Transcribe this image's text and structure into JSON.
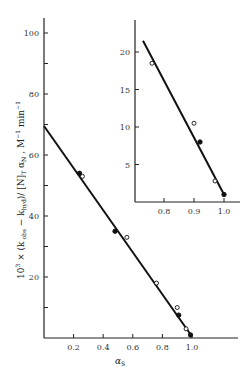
{
  "chart_data": [
    {
      "type": "scatter",
      "name": "main",
      "title": "",
      "xlabel": "α_S",
      "ylabel": "10³ × (k_obs − k_hyd)/ [N]_T α_N , M⁻¹ min⁻¹",
      "xlim": [
        0,
        1.1
      ],
      "ylim": [
        0,
        105
      ],
      "x_ticks": [
        0.2,
        0.4,
        0.6,
        0.8,
        1.0
      ],
      "x_tick_labels": [
        "0.2",
        "0.4",
        "0.6",
        "0.8",
        "1.0"
      ],
      "y_ticks": [
        10,
        20,
        30,
        40,
        50,
        60,
        70,
        80,
        90,
        100
      ],
      "y_tick_labels": [
        "20",
        "40",
        "60",
        "80",
        "100"
      ],
      "grid": false,
      "series": [
        {
          "name": "open circles",
          "marker": "open-circle",
          "x": [
            0.26,
            0.56,
            0.76,
            0.9,
            0.96
          ],
          "y": [
            53,
            33,
            18,
            10,
            3
          ]
        },
        {
          "name": "filled circles",
          "marker": "filled-circle",
          "x": [
            0.24,
            0.48,
            0.91,
            0.99
          ],
          "y": [
            54,
            35,
            7.5,
            1
          ]
        }
      ],
      "fit_line": {
        "x": [
          0,
          1.0
        ],
        "y": [
          69.5,
          0.5
        ]
      }
    },
    {
      "type": "scatter",
      "name": "inset",
      "title": "",
      "xlabel": "",
      "ylabel": "",
      "xlim": [
        0.7,
        1.05
      ],
      "ylim": [
        0,
        24
      ],
      "x_ticks": [
        0.8,
        0.9,
        1.0
      ],
      "x_tick_labels": [
        "0.8",
        "0.9",
        "1.0"
      ],
      "y_ticks": [
        5,
        10,
        15,
        20
      ],
      "y_tick_labels": [
        "5",
        "10",
        "15",
        "20"
      ],
      "grid": false,
      "series": [
        {
          "name": "open circles",
          "marker": "open-circle",
          "x": [
            0.76,
            0.9,
            0.97
          ],
          "y": [
            18.5,
            10.5,
            2.8
          ]
        },
        {
          "name": "filled circles",
          "marker": "filled-circle",
          "x": [
            0.92,
            1.0
          ],
          "y": [
            8.0,
            1.0
          ]
        }
      ],
      "fit_line": {
        "x": [
          0.73,
          1.0
        ],
        "y": [
          21.5,
          1.0
        ]
      }
    }
  ],
  "labels": {
    "main_y_axis": "10³ × (k obs − k hyd)/ [N]T αN , M⁻¹ min⁻¹",
    "main_x_axis": "α S"
  }
}
